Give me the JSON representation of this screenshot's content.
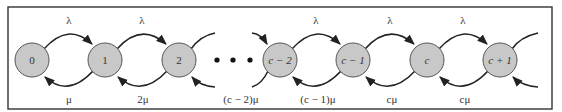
{
  "diagram": {
    "states": [
      {
        "id": "s0",
        "label": "0",
        "italic": false
      },
      {
        "id": "s1",
        "label": "1",
        "italic": false
      },
      {
        "id": "s2",
        "label": "2",
        "italic": false
      },
      {
        "id": "sc2",
        "label": "c − 2",
        "italic": true
      },
      {
        "id": "sc1",
        "label": "c − 1",
        "italic": true
      },
      {
        "id": "sc",
        "label": "c",
        "italic": true
      },
      {
        "id": "sc+1",
        "label": "c + 1",
        "italic": true
      }
    ],
    "ellipsis": "• • •",
    "forward_rates": [
      {
        "from": "0",
        "to": "1",
        "label": "λ"
      },
      {
        "from": "1",
        "to": "2",
        "label": "λ"
      },
      {
        "from": "c − 2",
        "to": "c − 1",
        "label": "λ"
      },
      {
        "from": "c − 1",
        "to": "c",
        "label": "λ"
      },
      {
        "from": "c",
        "to": "c + 1",
        "label": "λ"
      }
    ],
    "backward_rates": [
      {
        "from": "1",
        "to": "0",
        "label": "μ"
      },
      {
        "from": "2",
        "to": "1",
        "label": "2μ"
      },
      {
        "from": "c − 2",
        "to": "c − 3",
        "label": "(c − 2)μ"
      },
      {
        "from": "c − 1",
        "to": "c − 2",
        "label": "(c − 1)μ"
      },
      {
        "from": "c",
        "to": "c − 1",
        "label": "cμ"
      },
      {
        "from": "c + 1",
        "to": "c",
        "label": "cμ"
      }
    ]
  }
}
